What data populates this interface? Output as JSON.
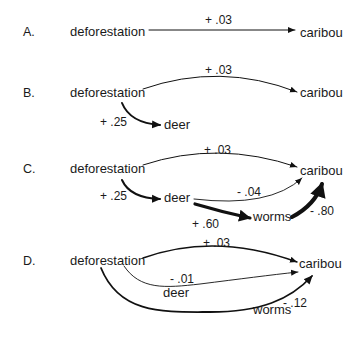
{
  "figure": {
    "panels": [
      {
        "label": "A.",
        "nodes": {
          "source": "deforestation",
          "target": "caribou"
        },
        "edges": [
          {
            "from": "deforestation",
            "to": "caribou",
            "coefficient": "+ .03",
            "value": 0.03,
            "weight": "thin"
          }
        ]
      },
      {
        "label": "B.",
        "nodes": {
          "source": "deforestation",
          "target": "caribou",
          "mediator1": "deer"
        },
        "edges": [
          {
            "from": "deforestation",
            "to": "caribou",
            "coefficient": "+ .03",
            "value": 0.03,
            "weight": "thin"
          },
          {
            "from": "deforestation",
            "to": "deer",
            "coefficient": "+ .25",
            "value": 0.25,
            "weight": "medium"
          }
        ]
      },
      {
        "label": "C.",
        "nodes": {
          "source": "deforestation",
          "target": "caribou",
          "mediator1": "deer",
          "mediator2": "worms"
        },
        "edges": [
          {
            "from": "deforestation",
            "to": "caribou",
            "coefficient": "+ .03",
            "value": 0.03,
            "weight": "thin"
          },
          {
            "from": "deforestation",
            "to": "deer",
            "coefficient": "+ .25",
            "value": 0.25,
            "weight": "medium"
          },
          {
            "from": "deer",
            "to": "caribou",
            "coefficient": "- .04",
            "value": -0.04,
            "weight": "thin"
          },
          {
            "from": "deer",
            "to": "worms",
            "coefficient": "+ .60",
            "value": 0.6,
            "weight": "thick"
          },
          {
            "from": "worms",
            "to": "caribou",
            "coefficient": "- .80",
            "value": -0.8,
            "weight": "thickest"
          }
        ]
      },
      {
        "label": "D.",
        "nodes": {
          "source": "deforestation",
          "target": "caribou",
          "mediator1": "deer",
          "mediator2": "worms"
        },
        "edges": [
          {
            "from": "deforestation",
            "to": "caribou",
            "coefficient": "+ .03",
            "value": 0.03,
            "weight": "thin"
          },
          {
            "from": "deforestation",
            "to": "caribou",
            "via": "deer",
            "coefficient": "- .01",
            "value": -0.01,
            "weight": "thin"
          },
          {
            "from": "deforestation",
            "to": "caribou",
            "via": "worms",
            "coefficient": "- .12",
            "value": -0.12,
            "weight": "medium"
          }
        ]
      }
    ]
  }
}
